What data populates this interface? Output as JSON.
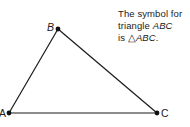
{
  "diagram": {
    "type": "triangle",
    "vertices": [
      {
        "name": "A",
        "x": 9,
        "y": 113
      },
      {
        "name": "B",
        "x": 58,
        "y": 29
      },
      {
        "name": "C",
        "x": 157,
        "y": 113
      }
    ],
    "labels": {
      "A": "A",
      "B": "B",
      "C": "C"
    },
    "stroke_color": "#1a1a1a"
  },
  "caption": {
    "line1": "The symbol for",
    "line2_prefix": "triangle ",
    "line2_name": "ABC",
    "line3_prefix": "is ",
    "line3_symbol": "△",
    "line3_name": "ABC",
    "line3_suffix": "."
  }
}
